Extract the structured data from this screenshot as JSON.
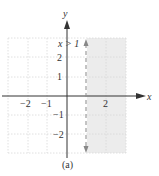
{
  "figure": {
    "caption": "(a)",
    "inequality_label": "x > 1",
    "axis_labels": {
      "x": "x",
      "y": "y"
    },
    "x_ticks": [
      {
        "value": -2,
        "label": "−2"
      },
      {
        "value": -1,
        "label": "−1"
      },
      {
        "value": 2,
        "label": "2"
      }
    ],
    "y_ticks": [
      {
        "value": 2,
        "label": "2"
      },
      {
        "value": 1,
        "label": "1"
      },
      {
        "value": -1,
        "label": "−1"
      },
      {
        "value": -2,
        "label": "−2"
      }
    ],
    "boundary": {
      "type": "dashed-vertical-line",
      "x": 1
    },
    "shaded_region": "x > 1",
    "colors": {
      "shade": "#ececec",
      "grid": "#d8d8d8",
      "axis": "#333333",
      "boundary": "#888888"
    }
  }
}
